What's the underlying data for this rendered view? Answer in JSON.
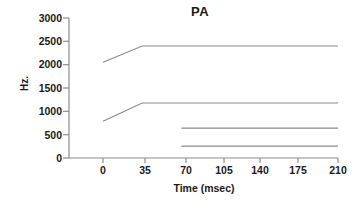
{
  "chart_data": {
    "type": "line",
    "title": "PA",
    "xlabel": "Time (msec)",
    "ylabel": "Hz.",
    "xlim": [
      0,
      210
    ],
    "ylim": [
      0,
      3000
    ],
    "xticks": [
      0,
      35,
      70,
      105,
      140,
      175,
      210
    ],
    "xtick_labels": [
      "0",
      "35",
      "70",
      "105",
      "140",
      "175",
      "210"
    ],
    "yticks": [
      0,
      500,
      1000,
      1500,
      2000,
      2500,
      3000
    ],
    "ytick_labels": [
      "0",
      "500",
      "1000",
      "1500",
      "2000",
      "2500",
      "3000"
    ],
    "grid": false,
    "legend": "none",
    "line_color": "#808080",
    "axis_color": "#8c8c8c",
    "text_color": "#1a1a1a",
    "series": [
      {
        "name": "F3",
        "x": [
          0,
          35,
          210
        ],
        "values": [
          2050,
          2400,
          2400
        ]
      },
      {
        "name": "F2",
        "x": [
          0,
          35,
          210
        ],
        "values": [
          790,
          1180,
          1180
        ]
      },
      {
        "name": "F1b",
        "x": [
          70,
          210
        ],
        "values": [
          640,
          640
        ]
      },
      {
        "name": "F1a",
        "x": [
          70,
          210
        ],
        "values": [
          255,
          255
        ]
      }
    ]
  }
}
